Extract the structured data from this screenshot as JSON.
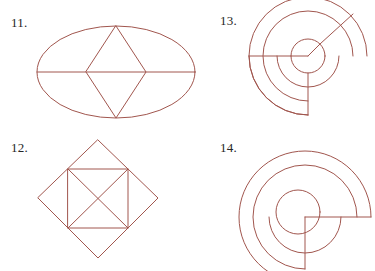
{
  "page": {
    "background_color": "#ffffff",
    "ink_color": "#a1564e",
    "label_color": "#262626",
    "width": 375,
    "height": 271
  },
  "figures": [
    {
      "label": "11.",
      "name": "ellipse-with-rhombus",
      "description": "Ellipse with an inscribed rhombus and a full horizontal diameter line",
      "shapes": {
        "ellipse": {
          "cx": 116,
          "cy": 72,
          "rx": 79,
          "ry": 46
        },
        "rhombus_points": "116,26 146,72 116,118 86,72",
        "diameter_line": {
          "x1": 37,
          "y1": 72,
          "x2": 195,
          "y2": 72
        }
      }
    },
    {
      "label": "12.",
      "name": "diamond-with-inscribed-square",
      "description": "Rotated square (diamond) with an axis-aligned square inscribed at the diamond edge midpoints, plus both square diagonals forming an X",
      "shapes": {
        "diamond_points": "98,5 158,63 98,123 38,63",
        "square_points": "68,34 128,34 128,93 68,93",
        "diagonal_a": {
          "x1": 68,
          "y1": 34,
          "x2": 128,
          "y2": 93
        },
        "diagonal_b": {
          "x1": 128,
          "y1": 34,
          "x2": 68,
          "y2": 93
        }
      }
    },
    {
      "label": "13.",
      "name": "spiral-of-arcs-large",
      "description": "Concentric spiral built from circular arcs around a central small circle with three radial spokes (upper-right diagonal, left horizontal, downward vertical)",
      "shapes": {
        "center": {
          "cx": 118,
          "cy": 56
        },
        "inner_circle_radius": 17,
        "arc_radii": [
          17,
          31,
          45,
          59
        ],
        "spokes": [
          {
            "name": "diagonal-upper-right",
            "x1": 118,
            "y1": 56,
            "x2": 160,
            "y2": 14
          },
          {
            "name": "horizontal-left",
            "x1": 118,
            "y1": 56,
            "x2": 59,
            "y2": 56
          },
          {
            "name": "vertical-down",
            "x1": 118,
            "y1": 56,
            "x2": 118,
            "y2": 115
          }
        ]
      }
    },
    {
      "label": "14.",
      "name": "spiral-of-arcs-small",
      "description": "Concentric spiral built from circular arcs with an inner circle, a horizontal segment to the right and a vertical segment going down",
      "shapes": {
        "center": {
          "cx": 115,
          "cy": 82
        },
        "arc_radii": [
          20,
          36,
          52,
          66
        ],
        "spokes": [
          {
            "name": "horizontal-right",
            "x1": 115,
            "y1": 82,
            "x2": 181,
            "y2": 82
          },
          {
            "name": "vertical-down",
            "x1": 115,
            "y1": 82,
            "x2": 115,
            "y2": 134
          }
        ]
      }
    }
  ]
}
